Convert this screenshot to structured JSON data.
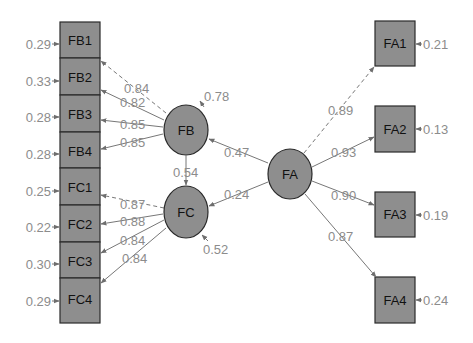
{
  "diagram": {
    "type": "sem-path-diagram",
    "colors": {
      "node_fill": "#8e8e8e",
      "node_stroke": "#2a2a2a",
      "edge": "#777777",
      "label": "#8c8c8c",
      "node_text": "#111111",
      "background": "#ffffff"
    },
    "latents": [
      {
        "id": "FB",
        "label": "FB",
        "residual": "0.78"
      },
      {
        "id": "FC",
        "label": "FC",
        "residual": "0.52"
      },
      {
        "id": "FA",
        "label": "FA"
      }
    ],
    "indicators_left": [
      {
        "id": "FB1",
        "label": "FB1",
        "residual": "0.29",
        "factor": "FB",
        "loading": "0.84",
        "fixed": true
      },
      {
        "id": "FB2",
        "label": "FB2",
        "residual": "0.33",
        "factor": "FB",
        "loading": "0.82",
        "fixed": false
      },
      {
        "id": "FB3",
        "label": "FB3",
        "residual": "0.28",
        "factor": "FB",
        "loading": "0.85",
        "fixed": false
      },
      {
        "id": "FB4",
        "label": "FB4",
        "residual": "0.28",
        "factor": "FB",
        "loading": "0.85",
        "fixed": false
      },
      {
        "id": "FC1",
        "label": "FC1",
        "residual": "0.25",
        "factor": "FC",
        "loading": "0.87",
        "fixed": true
      },
      {
        "id": "FC2",
        "label": "FC2",
        "residual": "0.22",
        "factor": "FC",
        "loading": "0.88",
        "fixed": false
      },
      {
        "id": "FC3",
        "label": "FC3",
        "residual": "0.30",
        "factor": "FC",
        "loading": "0.84",
        "fixed": false
      },
      {
        "id": "FC4",
        "label": "FC4",
        "residual": "0.29",
        "factor": "FC",
        "loading": "0.84",
        "fixed": false
      }
    ],
    "indicators_right": [
      {
        "id": "FA1",
        "label": "FA1",
        "residual": "0.21",
        "factor": "FA",
        "loading": "0.89",
        "fixed": true
      },
      {
        "id": "FA2",
        "label": "FA2",
        "residual": "0.13",
        "factor": "FA",
        "loading": "0.93",
        "fixed": false
      },
      {
        "id": "FA3",
        "label": "FA3",
        "residual": "0.19",
        "factor": "FA",
        "loading": "0.90",
        "fixed": false
      },
      {
        "id": "FA4",
        "label": "FA4",
        "residual": "0.24",
        "factor": "FA",
        "loading": "0.87",
        "fixed": false
      }
    ],
    "structural_paths": [
      {
        "from": "FA",
        "to": "FB",
        "coef": "0.47"
      },
      {
        "from": "FA",
        "to": "FC",
        "coef": "0.24"
      },
      {
        "from": "FB",
        "to": "FC",
        "coef": "0.54"
      }
    ]
  }
}
